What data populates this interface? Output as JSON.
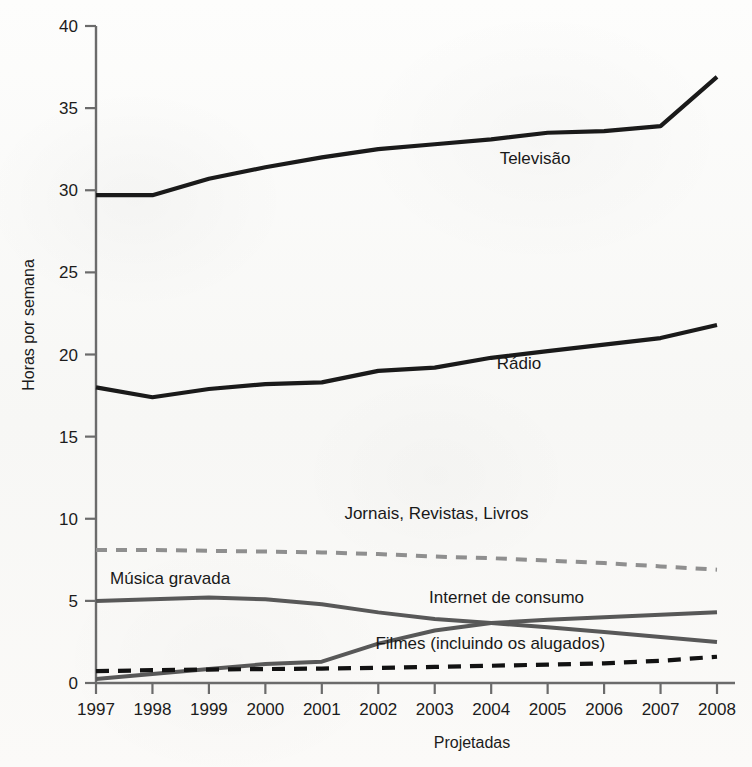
{
  "chart_data": {
    "type": "line",
    "title": "",
    "subtitle": "",
    "xlabel": "Projetadas",
    "ylabel": "Horas por semana",
    "x": [
      1997,
      1998,
      1999,
      2000,
      2001,
      2002,
      2003,
      2004,
      2005,
      2006,
      2007,
      2008
    ],
    "xticklabels": [
      "1997",
      "1998",
      "1999",
      "2000",
      "2001",
      "2002",
      "2003",
      "2004",
      "2005",
      "2006",
      "2007",
      "2008"
    ],
    "yticks": [
      0,
      5,
      10,
      15,
      20,
      25,
      30,
      35,
      40
    ],
    "yticklabels": [
      "0",
      "5",
      "10",
      "15",
      "20",
      "25",
      "30",
      "35",
      "40"
    ],
    "xlim": [
      1997,
      2008
    ],
    "ylim": [
      0,
      40
    ],
    "grid": false,
    "legend_position": "inline-annotations",
    "series": [
      {
        "name": "Televisão",
        "label": "Televisão",
        "color": "#1a1a1a",
        "style": "solid",
        "width": 4.2,
        "label_x": 2004.15,
        "label_y": 31.6,
        "values": [
          29.7,
          29.7,
          30.7,
          31.4,
          32.0,
          32.5,
          32.8,
          33.1,
          33.5,
          33.6,
          33.9,
          36.9
        ]
      },
      {
        "name": "Rádio",
        "label": "Rádio",
        "color": "#1a1a1a",
        "style": "solid",
        "width": 4.2,
        "label_x": 2004.1,
        "label_y": 19.1,
        "values": [
          18.0,
          17.4,
          17.9,
          18.2,
          18.3,
          19.0,
          19.2,
          19.8,
          20.2,
          20.6,
          21.0,
          21.8
        ]
      },
      {
        "name": "Jornais, Revistas, Livros",
        "label": "Jornais, Revistas, Livros",
        "color": "#8f8f8f",
        "style": "dashed",
        "width": 4.0,
        "label_x": 2001.4,
        "label_y": 10.0,
        "values": [
          8.1,
          8.1,
          8.05,
          8.0,
          7.95,
          7.85,
          7.7,
          7.6,
          7.45,
          7.3,
          7.1,
          6.9
        ]
      },
      {
        "name": "Música gravada",
        "label": "Música gravada",
        "color": "#585858",
        "style": "solid",
        "width": 4.0,
        "label_x": 1997.25,
        "label_y": 6.05,
        "values": [
          5.0,
          5.1,
          5.2,
          5.1,
          4.8,
          4.3,
          3.9,
          3.65,
          3.4,
          3.1,
          2.8,
          2.5
        ]
      },
      {
        "name": "Internet de consumo",
        "label": "Internet de consumo",
        "color": "#585858",
        "style": "solid",
        "width": 4.0,
        "label_x": 2002.9,
        "label_y": 4.85,
        "values": [
          0.25,
          0.55,
          0.85,
          1.15,
          1.3,
          2.4,
          3.2,
          3.65,
          3.85,
          4.0,
          4.15,
          4.3
        ]
      },
      {
        "name": "Filmes (incluindo os alugados)",
        "label": "Filmes (incluindo os alugados)",
        "color": "#121212",
        "style": "dashed",
        "width": 4.2,
        "label_x": 2001.95,
        "label_y": 2.05,
        "values": [
          0.72,
          0.78,
          0.82,
          0.85,
          0.88,
          0.92,
          0.98,
          1.05,
          1.12,
          1.2,
          1.35,
          1.6
        ]
      }
    ]
  },
  "axis": {
    "y_title": "Horas por semana",
    "x_title": "Projetadas"
  },
  "colors": {
    "axis": "#6b6b6b",
    "text": "#1c1c1c",
    "dark_series": "#1a1a1a",
    "mid_gray_series": "#585858",
    "light_gray_series": "#8f8f8f",
    "background": "#fbfbfa"
  }
}
